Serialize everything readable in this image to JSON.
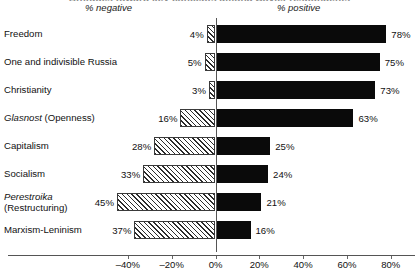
{
  "title_clipped": "Attitudes toward key concepts among Soviet respondents",
  "captions": {
    "negative": "% negative",
    "positive": "% positive"
  },
  "axis": {
    "ticks": [
      "–40%",
      "–20%",
      "0%",
      "20%",
      "40%",
      "60%",
      "80%"
    ],
    "tick_values": [
      -40,
      -20,
      0,
      20,
      40,
      60,
      80
    ],
    "min": -50,
    "max": 90
  },
  "rows": [
    {
      "label": "Freedom",
      "label_italic": "",
      "label_rest": "Freedom",
      "label_line2": "",
      "neg": 4,
      "pos": 78,
      "neg_label": "4%",
      "pos_label": "78%"
    },
    {
      "label": "One and indivisible Russia",
      "label_italic": "",
      "label_rest": "One and indivisible Russia",
      "label_line2": "",
      "neg": 5,
      "pos": 75,
      "neg_label": "5%",
      "pos_label": "75%"
    },
    {
      "label": "Christianity",
      "label_italic": "",
      "label_rest": "Christianity",
      "label_line2": "",
      "neg": 3,
      "pos": 73,
      "neg_label": "3%",
      "pos_label": "73%"
    },
    {
      "label": "Glasnost (Openness)",
      "label_italic": "Glasnost",
      "label_rest": " (Openness)",
      "label_line2": "",
      "neg": 16,
      "pos": 63,
      "neg_label": "16%",
      "pos_label": "63%"
    },
    {
      "label": "Capitalism",
      "label_italic": "",
      "label_rest": "Capitalism",
      "label_line2": "",
      "neg": 28,
      "pos": 25,
      "neg_label": "28%",
      "pos_label": "25%"
    },
    {
      "label": "Socialism",
      "label_italic": "",
      "label_rest": "Socialism",
      "label_line2": "",
      "neg": 33,
      "pos": 24,
      "neg_label": "33%",
      "pos_label": "24%"
    },
    {
      "label": "Perestroika (Restructuring)",
      "label_italic": "Perestroika",
      "label_rest": "",
      "label_line2": "(Restructuring)",
      "neg": 45,
      "pos": 21,
      "neg_label": "45%",
      "pos_label": "21%"
    },
    {
      "label": "Marxism-Leninism",
      "label_italic": "",
      "label_rest": "Marxism-Leninism",
      "label_line2": "",
      "neg": 37,
      "pos": 16,
      "neg_label": "37%",
      "pos_label": "16%"
    }
  ],
  "colors": {
    "positive_bar": "#0a0a0a",
    "negative_bar_hatch": "#2b2b2b",
    "axis": "#555555",
    "text": "#111111",
    "background": "#ffffff"
  },
  "chart_data": {
    "type": "bar",
    "title": "Attitudes toward key concepts among Soviet respondents",
    "subtitle": "",
    "xlabel": "",
    "ylabel": "",
    "orientation": "horizontal",
    "stacked": "diverging",
    "grid": false,
    "legend_position": "top",
    "xlim": [
      -50,
      90
    ],
    "xticks": [
      -40,
      -20,
      0,
      20,
      40,
      60,
      80
    ],
    "xticklabels": [
      "–40%",
      "–20%",
      "0%",
      "20%",
      "40%",
      "60%",
      "80%"
    ],
    "categories": [
      "Freedom",
      "One and indivisible Russia",
      "Christianity",
      "Glasnost (Openness)",
      "Capitalism",
      "Socialism",
      "Perestroika (Restructuring)",
      "Marxism-Leninism"
    ],
    "series": [
      {
        "name": "% negative",
        "fill": "hatched",
        "values": [
          -4,
          -5,
          -3,
          -16,
          -28,
          -33,
          -45,
          -37
        ],
        "labels": [
          "4%",
          "5%",
          "3%",
          "16%",
          "28%",
          "33%",
          "45%",
          "37%"
        ]
      },
      {
        "name": "% positive",
        "fill": "solid-black",
        "values": [
          78,
          75,
          73,
          63,
          25,
          24,
          21,
          16
        ],
        "labels": [
          "78%",
          "75%",
          "73%",
          "63%",
          "25%",
          "24%",
          "21%",
          "16%"
        ]
      }
    ]
  }
}
